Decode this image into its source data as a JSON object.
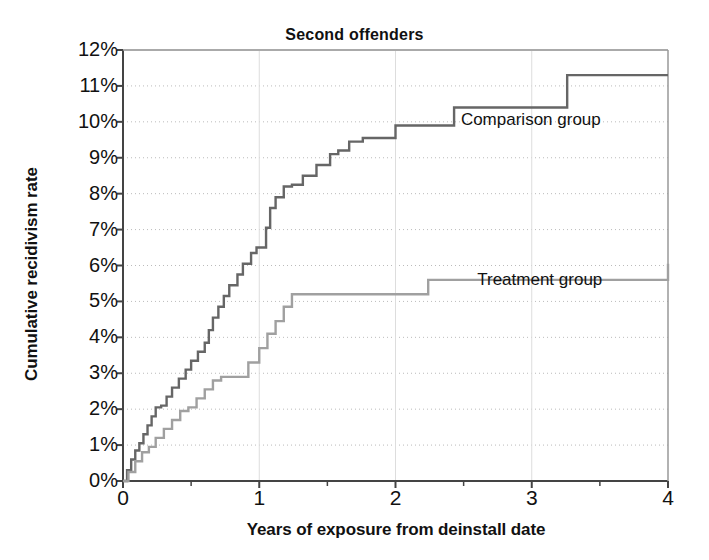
{
  "chart_data": {
    "type": "line",
    "title": "Second offenders",
    "xlabel": "Years of exposure from deinstall date",
    "ylabel": "Cumulative recidivism rate",
    "xlim": [
      0,
      4
    ],
    "ylim": [
      0,
      12
    ],
    "xticks": [
      0,
      1,
      2,
      3,
      4
    ],
    "xtick_labels": [
      "0",
      "1",
      "2",
      "3",
      "4"
    ],
    "yticks": [
      0,
      1,
      2,
      3,
      4,
      5,
      6,
      7,
      8,
      9,
      10,
      11,
      12
    ],
    "ytick_labels": [
      "0%",
      "1%",
      "2%",
      "3%",
      "4%",
      "5%",
      "6%",
      "7%",
      "8%",
      "9%",
      "10%",
      "11%",
      "12%"
    ],
    "grid": true,
    "grid_style": "dotted-horizontal",
    "legend_position": "inline-annotation",
    "step_style": "post",
    "series": [
      {
        "name": "Comparison group",
        "color": "#666666",
        "label_x": 2.48,
        "label_y": 10.05,
        "x": [
          0.0,
          0.03,
          0.06,
          0.09,
          0.12,
          0.15,
          0.18,
          0.21,
          0.24,
          0.28,
          0.32,
          0.36,
          0.41,
          0.46,
          0.5,
          0.55,
          0.6,
          0.63,
          0.66,
          0.7,
          0.74,
          0.78,
          0.84,
          0.88,
          0.94,
          0.98,
          1.02,
          1.05,
          1.08,
          1.12,
          1.18,
          1.24,
          1.32,
          1.42,
          1.52,
          1.58,
          1.66,
          1.76,
          2.0,
          2.43,
          3.26,
          4.0
        ],
        "y": [
          0.0,
          0.3,
          0.6,
          0.85,
          1.05,
          1.3,
          1.55,
          1.8,
          2.05,
          2.1,
          2.35,
          2.6,
          2.85,
          3.1,
          3.35,
          3.6,
          3.85,
          4.2,
          4.55,
          4.85,
          5.15,
          5.45,
          5.75,
          6.05,
          6.35,
          6.5,
          6.5,
          7.05,
          7.6,
          7.9,
          8.2,
          8.25,
          8.5,
          8.8,
          9.1,
          9.2,
          9.45,
          9.55,
          9.9,
          10.4,
          11.3,
          11.3
        ]
      },
      {
        "name": "Treatment group",
        "color": "#a0a0a0",
        "label_x": 2.6,
        "label_y": 5.6,
        "x": [
          0.0,
          0.04,
          0.09,
          0.14,
          0.19,
          0.24,
          0.3,
          0.36,
          0.42,
          0.48,
          0.54,
          0.6,
          0.66,
          0.72,
          0.78,
          0.84,
          0.92,
          1.0,
          1.06,
          1.12,
          1.18,
          1.24,
          2.04,
          2.24,
          4.0
        ],
        "y": [
          0.0,
          0.25,
          0.55,
          0.8,
          0.95,
          1.2,
          1.45,
          1.7,
          1.95,
          2.05,
          2.3,
          2.55,
          2.8,
          2.9,
          2.9,
          2.9,
          3.3,
          3.7,
          4.1,
          4.45,
          4.85,
          5.2,
          5.2,
          5.6,
          6.05
        ]
      }
    ]
  },
  "axes": {
    "axis_color": "#444444",
    "grid_color": "#bbbbbb",
    "plot_left_px": 123,
    "plot_right_px": 668,
    "plot_top_px": 50,
    "plot_bottom_px": 481
  }
}
